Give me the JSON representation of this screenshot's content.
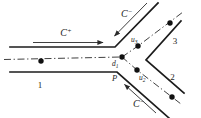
{
  "figure": {
    "colors": {
      "ink": "#1c1c1c",
      "background": "#ffffff"
    },
    "labels": {
      "c_plus": {
        "base": "C",
        "sup": "+"
      },
      "c_minus_top": {
        "base": "C",
        "sup": "−"
      },
      "c_minus_bottom": {
        "base": "C",
        "sup": "−"
      },
      "u3": {
        "base": "u",
        "sub": "3"
      },
      "u2": {
        "base": "u",
        "sub": "2"
      },
      "d1": {
        "base": "d",
        "sub": "1"
      },
      "point_p": "P",
      "duct_1": "1",
      "duct_2": "2",
      "duct_3": "3"
    }
  }
}
